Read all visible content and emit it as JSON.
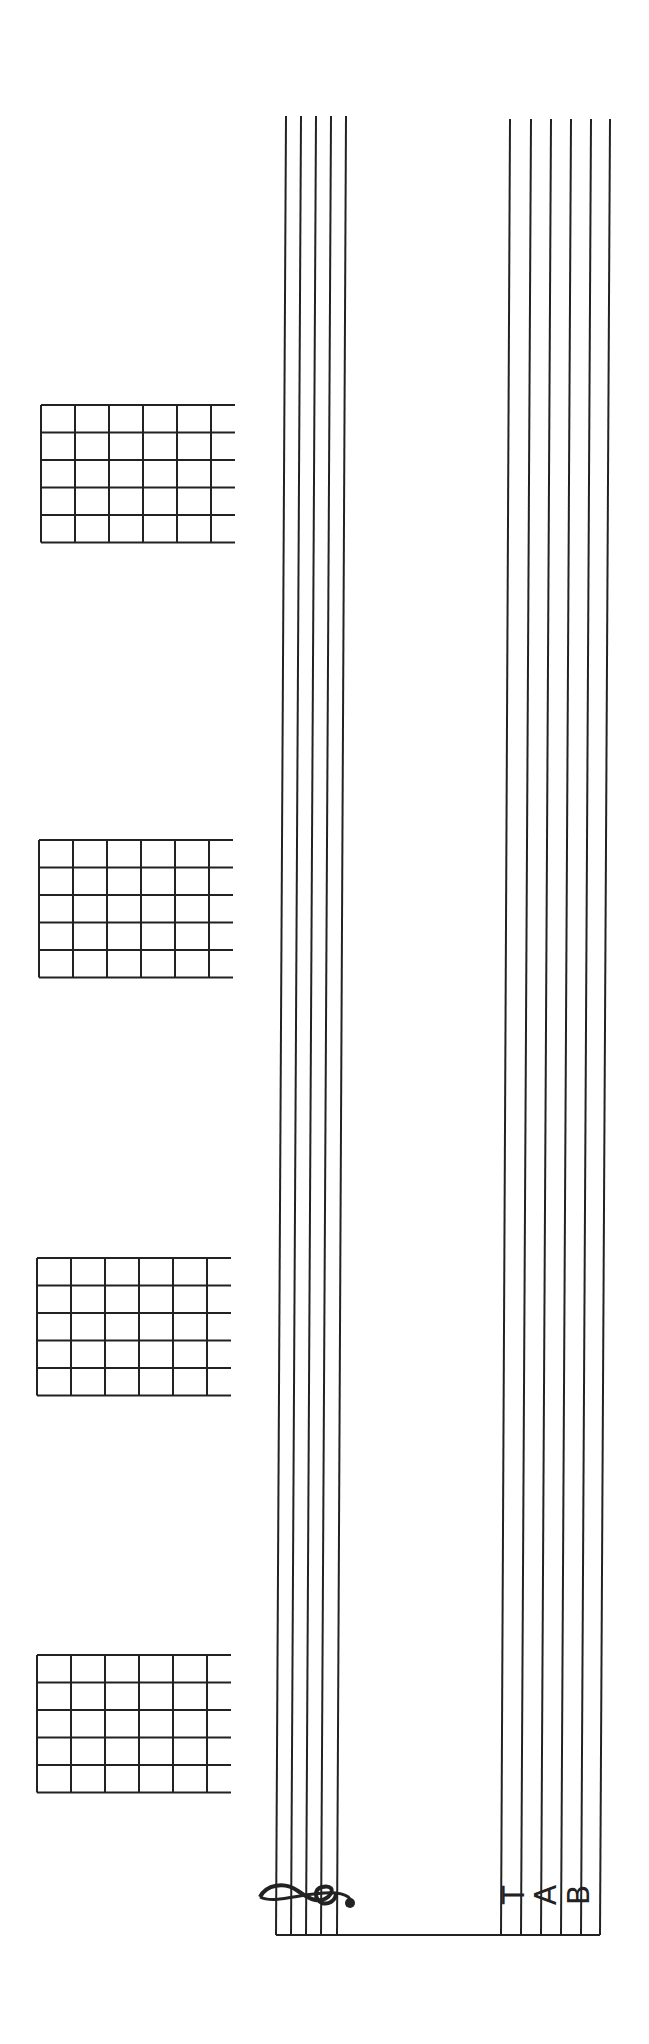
{
  "page": {
    "orientation": "rotated-90",
    "ink_color": "#222222",
    "background": "#ffffff"
  },
  "staff": {
    "clef": "treble-clef",
    "line_count": 5,
    "lines_top_x": [
      286,
      301,
      316,
      331,
      346
    ],
    "lines_bottom_x": [
      276,
      291,
      306,
      321,
      337
    ],
    "top_y": 116,
    "bottom_y": 1935
  },
  "tab": {
    "label": [
      "T",
      "A",
      "B"
    ],
    "line_count": 6,
    "lines_top_x": [
      510,
      531,
      551,
      571,
      591,
      610
    ],
    "lines_bottom_x": [
      501,
      521,
      541,
      561,
      581,
      600
    ],
    "top_y": 119,
    "bottom_y": 1935
  },
  "chord_diagrams": [
    {
      "id": "chord-1",
      "x": 41,
      "y": 405,
      "strings": 6,
      "frets": 5
    },
    {
      "id": "chord-2",
      "x": 39,
      "y": 840,
      "strings": 6,
      "frets": 5
    },
    {
      "id": "chord-3",
      "x": 37,
      "y": 1258,
      "strings": 6,
      "frets": 5
    },
    {
      "id": "chord-4",
      "x": 37,
      "y": 1655,
      "strings": 6,
      "frets": 5
    }
  ]
}
